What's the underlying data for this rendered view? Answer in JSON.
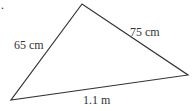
{
  "figure": {
    "number_fragment": ".",
    "shape": "triangle",
    "sides": [
      {
        "id": "left",
        "label": "65 cm"
      },
      {
        "id": "right",
        "label": "75 cm"
      },
      {
        "id": "bottom",
        "label": "1.1 m"
      }
    ],
    "stroke_color": "#333333"
  }
}
